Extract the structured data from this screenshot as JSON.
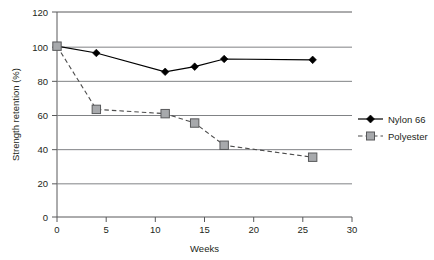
{
  "chart_data": {
    "type": "line",
    "title": "",
    "xlabel": "Weeks",
    "ylabel": "Strength retention (%)",
    "xlim": [
      0,
      30
    ],
    "ylim": [
      0,
      120
    ],
    "xticks": [
      0,
      5,
      10,
      15,
      20,
      25,
      30
    ],
    "yticks": [
      0,
      20,
      40,
      60,
      80,
      100,
      120
    ],
    "grid": "horizontal",
    "legend_position": "right",
    "series": [
      {
        "name": "Nylon 66",
        "marker": "diamond",
        "marker_color": "#000000",
        "line_style": "solid",
        "line_color": "#000000",
        "x": [
          0,
          4,
          11,
          14,
          17,
          26
        ],
        "values": [
          100,
          96,
          85,
          88,
          92.5,
          92
        ]
      },
      {
        "name": "Polyester",
        "marker": "square",
        "marker_color": "#a7a9ac",
        "line_style": "dashed",
        "line_color": "#4d4d4d",
        "x": [
          0,
          4,
          11,
          14,
          17,
          26
        ],
        "values": [
          100,
          63,
          60.5,
          55,
          42,
          35
        ]
      }
    ]
  },
  "axes": {
    "y_title": "Strength retention (%)",
    "x_title": "Weeks",
    "y_tick_labels": [
      "0",
      "20",
      "40",
      "60",
      "80",
      "100",
      "120"
    ],
    "x_tick_labels": [
      "0",
      "5",
      "10",
      "15",
      "20",
      "25",
      "30"
    ]
  },
  "legend": {
    "entries": [
      {
        "label": "Nylon 66"
      },
      {
        "label": "Polyester"
      }
    ]
  }
}
